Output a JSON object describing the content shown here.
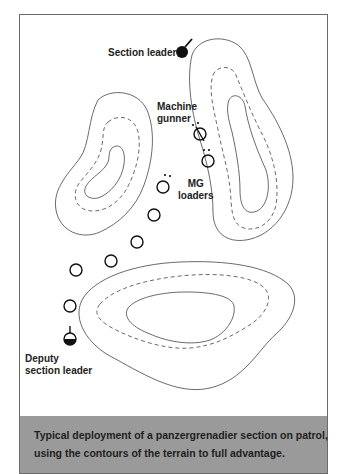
{
  "diagram": {
    "labels": {
      "section_leader": "Section leader",
      "machine_gunner_1": "Machine",
      "machine_gunner_2": "gunner",
      "mg_loaders_1": "MG",
      "mg_loaders_2": "loaders",
      "deputy_1": "Deputy",
      "deputy_2": "section leader"
    },
    "icons": [
      "section-leader-marker",
      "machine-gunner-marker",
      "mg-loader-marker",
      "soldier-marker",
      "deputy-leader-marker"
    ],
    "terrain": [
      "contour-hill-north-east",
      "contour-hill-west",
      "contour-hill-south"
    ]
  },
  "caption": {
    "line1": "Typical deployment of a panzergrenadier section on patrol,",
    "line2": "using the contours of the terrain to full advantage."
  },
  "colors": {
    "caption_bg": "#9a9a9a",
    "frame_border": "#6a6a6a",
    "ink": "#111111"
  }
}
